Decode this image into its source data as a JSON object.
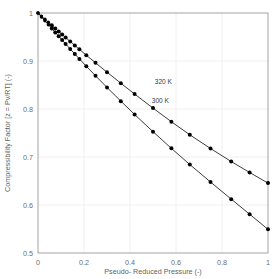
{
  "chart_data": {
    "type": "line",
    "title": "",
    "xlabel": "Pseudo- Reduced Pressure (-)",
    "ylabel": "Compressibility Factor [z = Pv/RT] (-)",
    "xlim": [
      0,
      1
    ],
    "ylim": [
      0.5,
      1
    ],
    "xticks": [
      "0",
      "0.2",
      "0.4",
      "0.6",
      "0.8",
      "1"
    ],
    "xtick_values": [
      0,
      0.2,
      0.4,
      0.6,
      0.8,
      1
    ],
    "yticks": [
      "0.5",
      "0.6",
      "0.7",
      "0.8",
      "0.9",
      "1"
    ],
    "ytick_values": [
      0.5,
      0.6,
      0.7,
      0.8,
      0.9,
      1
    ],
    "grid": true,
    "legend_position": "inline-annotation",
    "marker": "filled-circle",
    "series": [
      {
        "name": "320 K",
        "label": "320 K",
        "color": "#000000",
        "annotation_x": 0.545,
        "annotation_y": 0.852,
        "x": [
          0.0,
          0.015,
          0.03,
          0.045,
          0.06,
          0.075,
          0.09,
          0.105,
          0.12,
          0.14,
          0.16,
          0.18,
          0.21,
          0.25,
          0.3,
          0.36,
          0.42,
          0.5,
          0.58,
          0.66,
          0.75,
          0.84,
          0.92,
          1.0
        ],
        "y": [
          1.0,
          0.9935,
          0.9871,
          0.9807,
          0.9743,
          0.9679,
          0.9616,
          0.9553,
          0.949,
          0.9407,
          0.9325,
          0.9243,
          0.9121,
          0.8962,
          0.8767,
          0.8537,
          0.8312,
          0.8019,
          0.7735,
          0.7462,
          0.7178,
          0.6905,
          0.6678,
          0.6456
        ]
      },
      {
        "name": "300 K",
        "label": "300 K",
        "color": "#000000",
        "annotation_x": 0.532,
        "annotation_y": 0.812,
        "x": [
          0.0,
          0.015,
          0.03,
          0.045,
          0.06,
          0.075,
          0.09,
          0.105,
          0.12,
          0.14,
          0.16,
          0.18,
          0.21,
          0.25,
          0.3,
          0.36,
          0.42,
          0.5,
          0.58,
          0.66,
          0.75,
          0.84,
          0.92,
          1.0
        ],
        "y": [
          1.0,
          0.9918,
          0.9837,
          0.9756,
          0.9675,
          0.9595,
          0.9515,
          0.9435,
          0.9356,
          0.9251,
          0.9147,
          0.9044,
          0.8891,
          0.8692,
          0.8449,
          0.8164,
          0.7886,
          0.7527,
          0.718,
          0.6843,
          0.6479,
          0.6122,
          0.5809,
          0.5493
        ]
      }
    ]
  },
  "axes": {
    "x_title": "Pseudo- Reduced Pressure (-)",
    "y_title": "Compressibility Factor [z = Pv/RT] (-)"
  }
}
